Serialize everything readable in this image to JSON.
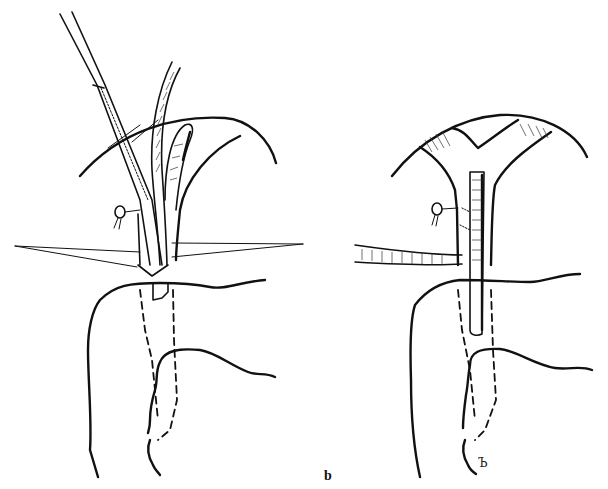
{
  "figure": {
    "panel_label": "b",
    "signature": "Ъ",
    "colors": {
      "ink": "#111111",
      "background": "#ffffff"
    },
    "panels": [
      {
        "id": "left",
        "description": "Liver hilum with catheter and dilator inserted into common bile duct, stay sutures, duodenum outline"
      },
      {
        "id": "right",
        "description": "Bifurcated hepatic ducts with stented common bile duct, side tube, duodenum outline"
      }
    ]
  }
}
